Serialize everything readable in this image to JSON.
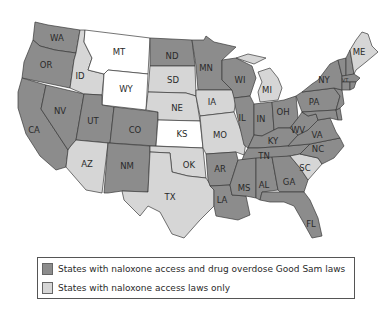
{
  "colors": {
    "both_laws": "#8c8c8c",
    "naloxone_only": "#d6d6d6",
    "neither": "#ffffff"
  },
  "legend": {
    "items": [
      {
        "label": "States with naloxone access and drug overdose Good Sam laws",
        "category": "both_laws"
      },
      {
        "label": "States with naloxone access laws only",
        "category": "naloxone_only"
      }
    ]
  },
  "states": {
    "WA": {
      "label": "WA",
      "category": "both_laws"
    },
    "OR": {
      "label": "OR",
      "category": "both_laws"
    },
    "CA": {
      "label": "CA",
      "category": "both_laws"
    },
    "NV": {
      "label": "NV",
      "category": "both_laws"
    },
    "ID": {
      "label": "ID",
      "category": "naloxone_only"
    },
    "MT": {
      "label": "MT",
      "category": "neither"
    },
    "WY": {
      "label": "WY",
      "category": "neither"
    },
    "UT": {
      "label": "UT",
      "category": "both_laws"
    },
    "CO": {
      "label": "CO",
      "category": "both_laws"
    },
    "AZ": {
      "label": "AZ",
      "category": "naloxone_only"
    },
    "NM": {
      "label": "NM",
      "category": "both_laws"
    },
    "ND": {
      "label": "ND",
      "category": "both_laws"
    },
    "SD": {
      "label": "SD",
      "category": "naloxone_only"
    },
    "NE": {
      "label": "NE",
      "category": "naloxone_only"
    },
    "KS": {
      "label": "KS",
      "category": "neither"
    },
    "OK": {
      "label": "OK",
      "category": "naloxone_only"
    },
    "TX": {
      "label": "TX",
      "category": "naloxone_only"
    },
    "MN": {
      "label": "MN",
      "category": "both_laws"
    },
    "IA": {
      "label": "IA",
      "category": "naloxone_only"
    },
    "MO": {
      "label": "MO",
      "category": "naloxone_only"
    },
    "AR": {
      "label": "AR",
      "category": "both_laws"
    },
    "LA": {
      "label": "LA",
      "category": "both_laws"
    },
    "WI": {
      "label": "WI",
      "category": "both_laws"
    },
    "IL": {
      "label": "IL",
      "category": "both_laws"
    },
    "MI": {
      "label": "MI",
      "category": "naloxone_only"
    },
    "IN": {
      "label": "IN",
      "category": "both_laws"
    },
    "OH": {
      "label": "OH",
      "category": "both_laws"
    },
    "KY": {
      "label": "KY",
      "category": "both_laws"
    },
    "TN": {
      "label": "TN",
      "category": "both_laws"
    },
    "MS": {
      "label": "MS",
      "category": "both_laws"
    },
    "AL": {
      "label": "AL",
      "category": "both_laws"
    },
    "GA": {
      "label": "GA",
      "category": "both_laws"
    },
    "FL": {
      "label": "FL",
      "category": "both_laws"
    },
    "SC": {
      "label": "SC",
      "category": "naloxone_only"
    },
    "NC": {
      "label": "NC",
      "category": "both_laws"
    },
    "VA": {
      "label": "VA",
      "category": "both_laws"
    },
    "WV": {
      "label": "WV",
      "category": "both_laws"
    },
    "PA": {
      "label": "PA",
      "category": "both_laws"
    },
    "NY": {
      "label": "NY",
      "category": "both_laws"
    },
    "VT": {
      "label": "VT",
      "category": "both_laws"
    },
    "ME": {
      "label": "ME",
      "category": "naloxone_only"
    },
    "NH": {
      "label": "",
      "category": "both_laws"
    },
    "MA": {
      "label": "",
      "category": "both_laws"
    },
    "CT": {
      "label": "",
      "category": "both_laws"
    },
    "RI": {
      "label": "",
      "category": "both_laws"
    },
    "NJ": {
      "label": "",
      "category": "both_laws"
    },
    "DE": {
      "label": "",
      "category": "both_laws"
    },
    "MD": {
      "label": "",
      "category": "both_laws"
    }
  }
}
